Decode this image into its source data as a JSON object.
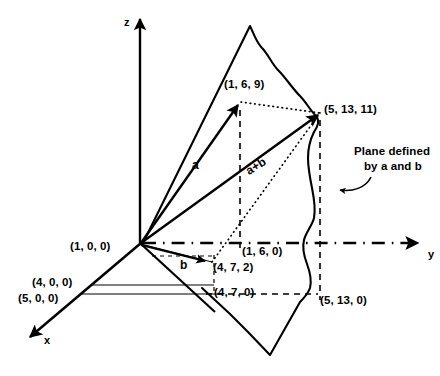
{
  "figure": {
    "type": "3d-vector-diagram"
  },
  "axes": {
    "x_label": "x",
    "y_label": "y",
    "z_label": "z"
  },
  "vectors": {
    "a_label": "a",
    "b_label": "b",
    "sum_label": "a+b"
  },
  "points": {
    "a_tip": "(1, 6, 9)",
    "sum_tip": "(5, 13, 11)",
    "b_tip": "(4, 7, 2)",
    "a_projection_xy": "(1, 6, 0)",
    "b_projection_xy": "(4, 7, 0)",
    "sum_projection_xy": "(5, 13, 0)",
    "x_1": "(1, 0, 0)",
    "x_4": "(4, 0, 0)",
    "x_5": "(5, 0, 0)"
  },
  "annotations": {
    "plane_note_line1": "Plane defined",
    "plane_note_line2": "by a and b"
  },
  "colors": {
    "ink": "#000000",
    "paper": "#ffffff"
  }
}
